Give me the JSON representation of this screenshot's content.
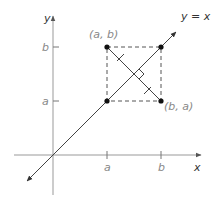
{
  "diagram": {
    "axes": {
      "x_label": "x",
      "y_label": "y"
    },
    "line_label": "y = x",
    "ticks": {
      "x": [
        "a",
        "b"
      ],
      "y": [
        "a",
        "b"
      ]
    },
    "points": [
      {
        "label": "(a, b)",
        "x": "a",
        "y": "b",
        "labeled": true
      },
      {
        "label": "(b, a)",
        "x": "b",
        "y": "a",
        "labeled": true
      },
      {
        "label": "",
        "x": "a",
        "y": "a",
        "labeled": false
      },
      {
        "label": "",
        "x": "b",
        "y": "b",
        "labeled": false
      }
    ],
    "annotations": {
      "dashed_square": "corners (a,a), (b,b)",
      "segment": "(a, b) to (b, a), perpendicular to y = x with equal-length tick marks",
      "right_angle_marker": true
    },
    "colors": {
      "axis": "#999999",
      "line": "#444444",
      "points": "#111111",
      "labels": "#888888"
    }
  }
}
